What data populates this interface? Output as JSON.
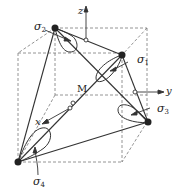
{
  "diagram": {
    "labels": {
      "sigma1": {
        "base": "σ",
        "sub": "1"
      },
      "sigma2": {
        "base": "σ",
        "sub": "2"
      },
      "sigma3": {
        "base": "σ",
        "sub": "3"
      },
      "sigma4": {
        "base": "σ",
        "sub": "4"
      },
      "point_m": "M",
      "axis_x": "x",
      "axis_y": "y",
      "axis_z": "z"
    },
    "colors": {
      "line": "#333333",
      "dashed": "#777777",
      "vertex": "#222222"
    }
  }
}
